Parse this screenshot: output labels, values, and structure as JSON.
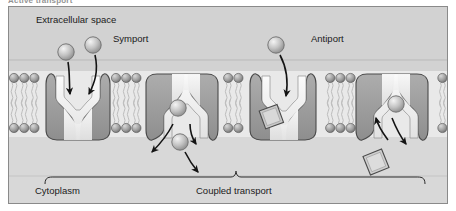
{
  "figure": {
    "title_clipped": "Active transport",
    "type": "membrane-transport-diagram"
  },
  "labels": {
    "extracellular": "Extracellular space",
    "symport": "Symport",
    "antiport": "Antiport",
    "cytoplasm": "Cytoplasm",
    "coupled_transport": "Coupled transport"
  },
  "colors": {
    "panel_background": "#dcdcdc",
    "extracellular_background": "#d2d2d2",
    "cytoplasm_background": "#d8d8d8",
    "membrane_band": "#e8e8e8",
    "protein_fill": "#9a9a9a",
    "protein_stroke": "#4a4a4a",
    "channel_fill": "#f2f2f2",
    "head_fill": "#9e9e9e",
    "tail_stroke": "#bdbdbd",
    "solute_circle": "#d6d6d6",
    "solute_square": "#c8c8c8",
    "arrow": "#141414",
    "frame_border": "#8a8a8a",
    "text": "#1a1a1a"
  },
  "membrane": {
    "top_head_row_y": 78,
    "bottom_head_row_y": 128,
    "head_radius": 4.6,
    "head_spacing": 10.2
  },
  "transporters": [
    {
      "name": "symport-carrier",
      "label": "Symport",
      "orientation": "open-to-extracellular",
      "center_x": 78,
      "solutes_in": 2,
      "solute_shape": "circle",
      "arrows": "two-inward-downward"
    },
    {
      "name": "symport-release-carrier",
      "label": "Coupled transport",
      "orientation": "open-to-cytoplasm",
      "center_x": 182,
      "solutes_in": 2,
      "solute_shape": "circle",
      "arrows": "two-outward-downward"
    },
    {
      "name": "antiport-carrier",
      "label": "Antiport",
      "orientation": "open-to-extracellular",
      "center_x": 283,
      "solute_shape": "circle-in-square-out",
      "arrows": "one-inward-downward"
    },
    {
      "name": "antiport-release-carrier",
      "label": "Coupled transport",
      "orientation": "open-to-cytoplasm",
      "center_x": 390,
      "solute_shape": "circle-and-square",
      "arrows": "one-up-one-down"
    }
  ],
  "solutes": {
    "free_extracellular_circles": 3,
    "free_cytoplasm_circles": 1,
    "free_cytoplasm_squares": 1
  },
  "brace": {
    "left_x": 45,
    "right_x": 425,
    "y": 178,
    "label": "Coupled transport"
  }
}
